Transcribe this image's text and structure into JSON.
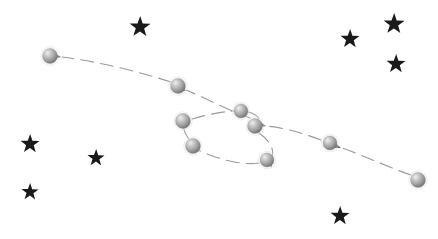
{
  "figure": {
    "background_color": "#ffffff",
    "width": 438,
    "height": 239
  },
  "style": {
    "path_color": "#9a9a9a",
    "arrow_color": "#555555",
    "star_color": "#1a1a1a",
    "sphere_light": "#e8e8e8",
    "sphere_mid": "#a8a8a8",
    "sphere_dark": "#6e6e6e"
  },
  "chart_data": {
    "type": "scatter",
    "xlabel": "",
    "ylabel": "",
    "xlim": [
      0,
      438
    ],
    "ylim": [
      0,
      239
    ],
    "grid": false,
    "legend": "none",
    "series": [
      {
        "name": "planet-positions",
        "marker": "shaded-sphere",
        "points": [
          {
            "label": "p1",
            "x": 418,
            "y": 180,
            "r": 7.5
          },
          {
            "label": "p2",
            "x": 330,
            "y": 143,
            "r": 7.0
          },
          {
            "label": "p3",
            "x": 255,
            "y": 126,
            "r": 7.5
          },
          {
            "label": "p4",
            "x": 267,
            "y": 160,
            "r": 7.0
          },
          {
            "label": "p5",
            "x": 193,
            "y": 146,
            "r": 7.5
          },
          {
            "label": "p6",
            "x": 183,
            "y": 121,
            "r": 7.5
          },
          {
            "label": "p7",
            "x": 241,
            "y": 111,
            "r": 7.0
          },
          {
            "label": "p8",
            "x": 178,
            "y": 86,
            "r": 7.5
          },
          {
            "label": "p9",
            "x": 50,
            "y": 56,
            "r": 7.5
          }
        ]
      },
      {
        "name": "background-stars",
        "marker": "five-point-star",
        "points": [
          {
            "label": "s1",
            "x": 140,
            "y": 27,
            "r": 11
          },
          {
            "label": "s2",
            "x": 350,
            "y": 39,
            "r": 10
          },
          {
            "label": "s3",
            "x": 394,
            "y": 24,
            "r": 11
          },
          {
            "label": "s4",
            "x": 396,
            "y": 64,
            "r": 10
          },
          {
            "label": "s5",
            "x": 30,
            "y": 144,
            "r": 10
          },
          {
            "label": "s6",
            "x": 96,
            "y": 158,
            "r": 9
          },
          {
            "label": "s7",
            "x": 30,
            "y": 192,
            "r": 9
          },
          {
            "label": "s8",
            "x": 340,
            "y": 216,
            "r": 10
          }
        ]
      }
    ],
    "path_segments": [
      {
        "label": "seg-1",
        "d": "M 411 175 C 390 168 365 156 342 148"
      },
      {
        "label": "seg-2",
        "d": "M 321 140 C 300 132 280 127 266 126"
      },
      {
        "label": "seg-3",
        "d": "M 259 133 C 272 142 275 152 271 159"
      },
      {
        "label": "seg-4",
        "d": "M 259 163 C 240 166 215 158 198 150"
      },
      {
        "label": "seg-5",
        "d": "M 189 139 C 184 133 183 128 184 123"
      },
      {
        "label": "seg-6",
        "d": "M 192 119 C 208 114 228 111 234 111"
      },
      {
        "label": "seg-7",
        "d": "M 248 112 C 256 114 260 118 259 121"
      },
      {
        "label": "seg-8",
        "d": "M 250 118 C 228 110 205 98 186 90"
      },
      {
        "label": "seg-9",
        "d": "M 171 82 C 140 72 100 62 62 57"
      }
    ],
    "arrow_heads": [
      {
        "label": "a1",
        "x": 341,
        "y": 148,
        "angle": 201
      },
      {
        "label": "a2",
        "x": 266,
        "y": 126,
        "angle": 192
      },
      {
        "label": "a3",
        "x": 271,
        "y": 160,
        "angle": 104
      },
      {
        "label": "a4",
        "x": 197,
        "y": 150,
        "angle": 205
      },
      {
        "label": "a5",
        "x": 185,
        "y": 124,
        "angle": 274
      },
      {
        "label": "a6",
        "x": 234,
        "y": 111,
        "angle": 5
      },
      {
        "label": "a7",
        "x": 259,
        "y": 122,
        "angle": 100
      },
      {
        "label": "a8",
        "x": 186,
        "y": 91,
        "angle": 205
      },
      {
        "label": "a9",
        "x": 61,
        "y": 57,
        "angle": 188
      }
    ]
  }
}
